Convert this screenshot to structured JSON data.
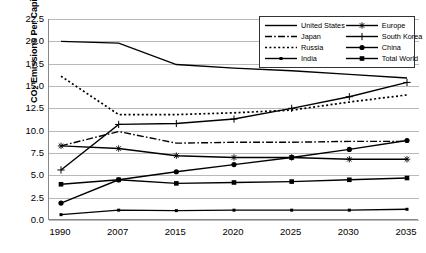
{
  "chart_data": {
    "type": "line",
    "title": "",
    "xlabel": "",
    "ylabel": "CO2 Emissions Per Capita",
    "ylabel_html": "CO₂ Emissions Per Capita",
    "categories": [
      "1990",
      "2007",
      "2015",
      "2020",
      "2025",
      "2030",
      "2035"
    ],
    "ylim": [
      0.0,
      22.5
    ],
    "yticks": [
      "0.0",
      "2.5",
      "5.0",
      "7.5",
      "10.0",
      "12.5",
      "15.0",
      "17.5",
      "20.0",
      "22.5"
    ],
    "ytick_values": [
      0.0,
      2.5,
      5.0,
      7.5,
      10.0,
      12.5,
      15.0,
      17.5,
      20.0,
      22.5
    ],
    "grid": true,
    "legend_position": "top-right",
    "series": [
      {
        "name": "United States",
        "style": "solid",
        "marker": "none",
        "color": "#000000",
        "values": [
          20.0,
          19.8,
          17.4,
          17.0,
          16.7,
          16.3,
          15.9
        ]
      },
      {
        "name": "Japan",
        "style": "dash-dot",
        "marker": "none",
        "color": "#000000",
        "values": [
          8.3,
          9.9,
          8.6,
          8.7,
          8.7,
          8.8,
          8.8
        ]
      },
      {
        "name": "Russia",
        "style": "dotted",
        "marker": "none",
        "color": "#000000",
        "values": [
          16.1,
          11.8,
          11.8,
          12.0,
          12.3,
          13.2,
          14.0
        ]
      },
      {
        "name": "India",
        "style": "solid",
        "marker": "square-small",
        "color": "#000000",
        "values": [
          0.6,
          1.1,
          1.05,
          1.1,
          1.1,
          1.1,
          1.2
        ]
      },
      {
        "name": "Europe",
        "style": "solid",
        "marker": "star",
        "color": "#000000",
        "values": [
          8.3,
          8.0,
          7.2,
          7.0,
          7.0,
          6.8,
          6.8
        ]
      },
      {
        "name": "South Korea",
        "style": "solid",
        "marker": "plus",
        "color": "#000000",
        "values": [
          5.6,
          10.7,
          10.8,
          11.3,
          12.5,
          13.8,
          15.4
        ]
      },
      {
        "name": "China",
        "style": "solid",
        "marker": "circle",
        "color": "#000000",
        "values": [
          1.9,
          4.5,
          5.4,
          6.2,
          7.0,
          7.9,
          8.9
        ]
      },
      {
        "name": "Total World",
        "style": "solid",
        "marker": "square",
        "color": "#000000",
        "values": [
          4.0,
          4.5,
          4.1,
          4.2,
          4.3,
          4.5,
          4.7
        ]
      }
    ]
  },
  "legend": {
    "entries": [
      {
        "label": "United States"
      },
      {
        "label": "Europe"
      },
      {
        "label": "Japan"
      },
      {
        "label": "South Korea"
      },
      {
        "label": "Russia"
      },
      {
        "label": "China"
      },
      {
        "label": "India"
      },
      {
        "label": "Total World"
      }
    ]
  }
}
